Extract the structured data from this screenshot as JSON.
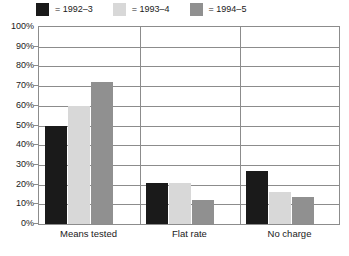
{
  "chart_data": {
    "type": "bar",
    "title": "",
    "subtitle": "",
    "xlabel": "",
    "ylabel": "",
    "ylim": [
      0,
      100
    ],
    "y_tick_step": 10,
    "grid": true,
    "legend_position": "top-left",
    "categories": [
      "Means tested",
      "Flat rate",
      "No charge"
    ],
    "series": [
      {
        "name": "1992–3",
        "color": "#1a1a1a",
        "values": [
          50,
          21,
          27
        ]
      },
      {
        "name": "1993–4",
        "color": "#d8d8d8",
        "values": [
          60,
          21,
          16
        ]
      },
      {
        "name": "1994–5",
        "color": "#909090",
        "values": [
          72,
          12,
          13.5
        ]
      }
    ],
    "y_tick_labels": [
      "100%",
      "90%",
      "80%",
      "70%",
      "60%",
      "50%",
      "40%",
      "30%",
      "20%",
      "10%",
      "0%"
    ],
    "y_tick_values": [
      100,
      90,
      80,
      70,
      60,
      50,
      40,
      30,
      20,
      10,
      0
    ]
  },
  "legend": {
    "entries": [
      {
        "equals": "= 1992–3",
        "swatch": "legend-swatch-1992-3"
      },
      {
        "equals": "= 1993–4",
        "swatch": "legend-swatch-1993-4"
      },
      {
        "equals": "= 1994–5",
        "swatch": "legend-swatch-1994-5"
      }
    ]
  },
  "colors": {
    "series_1": "#1a1a1a",
    "series_2": "#d8d8d8",
    "series_3": "#909090",
    "axis": "#8c8c8c",
    "grid": "#8c8c8c",
    "background": "#ffffff",
    "text": "#1a1a1a"
  }
}
